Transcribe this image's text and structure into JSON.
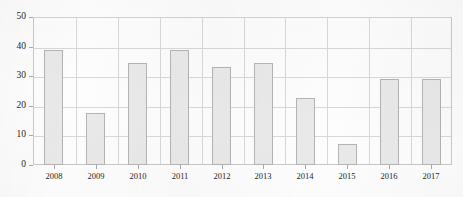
{
  "chart_data": {
    "type": "bar",
    "title": "",
    "xlabel": "",
    "ylabel": "",
    "categories": [
      "2008",
      "2009",
      "2010",
      "2011",
      "2012",
      "2013",
      "2014",
      "2015",
      "2016",
      "2017"
    ],
    "values": [
      39,
      17.5,
      34.5,
      39,
      33,
      34.5,
      22.5,
      7,
      29,
      29
    ],
    "ylim": [
      0,
      50
    ],
    "yticks": [
      "0",
      "10",
      "20",
      "30",
      "40",
      "50"
    ],
    "ytick_values": [
      0,
      10,
      20,
      30,
      40,
      50
    ],
    "grid": true,
    "legend": false,
    "bar_fill": "#e9e9e9",
    "bar_border": "#b4b4b4",
    "grid_color": "#d8d8d8",
    "axis_color": "#c9c9c9",
    "text_color": "#1d1d1d"
  }
}
